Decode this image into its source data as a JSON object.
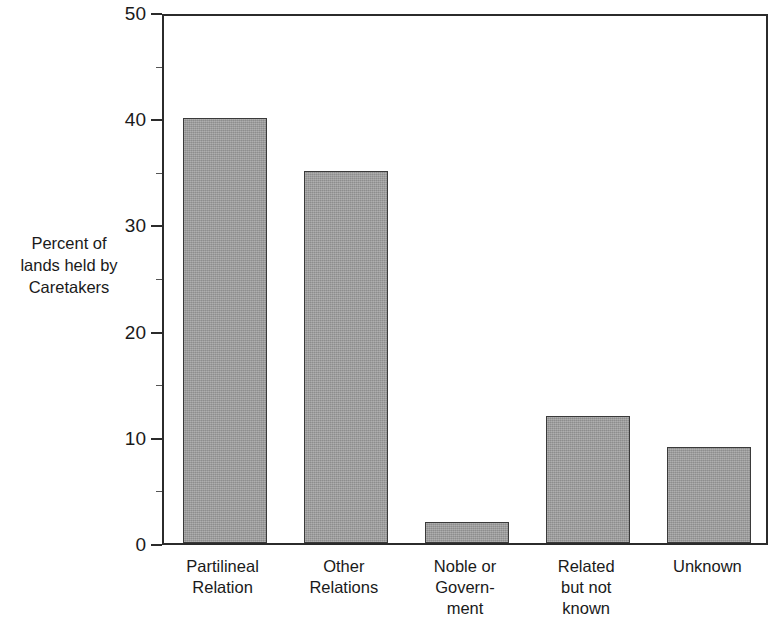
{
  "chart_data": {
    "type": "bar",
    "title": "",
    "subtitle": "",
    "xlabel": "",
    "ylabel": "Percent of\nlands held by\nCaretakers",
    "categories": [
      "Partilineal\nRelation",
      "Other\nRelations",
      "Noble or\nGovern-\nment",
      "Related\nbut not\nknown",
      "Unknown"
    ],
    "values": [
      40,
      35,
      2,
      12,
      9
    ],
    "ylim": [
      0,
      50
    ],
    "ytick_labels": [
      "0",
      "10",
      "20",
      "30",
      "40",
      "50"
    ],
    "ytick_values": [
      0,
      10,
      20,
      30,
      40,
      50
    ],
    "yminor_tick_values": [
      5,
      15,
      25,
      35,
      45
    ],
    "grid": false,
    "legend": null,
    "legend_position": "none",
    "bar_fill_color": "#9e9e9e",
    "bar_edge_color": "#3a3a3a",
    "axis_color": "#2b2b2b",
    "background_color": "#ffffff"
  },
  "axis": {
    "y_title": "Percent of\nlands held by\nCaretakers",
    "ticks": [
      {
        "label": "50",
        "value": 50
      },
      {
        "label": "40",
        "value": 40
      },
      {
        "label": "30",
        "value": 30
      },
      {
        "label": "20",
        "value": 20
      },
      {
        "label": "10",
        "value": 10
      },
      {
        "label": "0",
        "value": 0
      }
    ]
  },
  "bars": [
    {
      "label": "Partilineal\nRelation",
      "value": 40
    },
    {
      "label": "Other\nRelations",
      "value": 35
    },
    {
      "label": "Noble or\nGovern-\nment",
      "value": 2
    },
    {
      "label": "Related\nbut not\nknown",
      "value": 12
    },
    {
      "label": "Unknown",
      "value": 9
    }
  ]
}
